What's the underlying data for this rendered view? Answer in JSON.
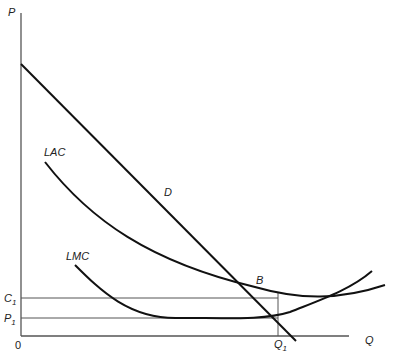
{
  "diagram": {
    "type": "economics-cost-demand",
    "axes": {
      "y_label": "P",
      "x_label": "Q",
      "origin_label": "0"
    },
    "curves": {
      "demand": "D",
      "long_run_average_cost": "LAC",
      "long_run_marginal_cost": "LMC"
    },
    "points": {
      "intersection": "B"
    },
    "levels": {
      "cost_level": {
        "base": "C",
        "sub": "1"
      },
      "price_level": {
        "base": "P",
        "sub": "1"
      },
      "quantity_level": {
        "base": "Q",
        "sub": "1"
      }
    },
    "colors": {
      "curve": "#111111",
      "axis": "#555555",
      "background": "#ffffff"
    }
  }
}
